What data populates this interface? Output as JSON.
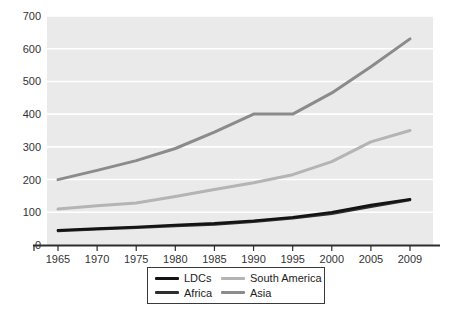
{
  "chart_data": {
    "type": "line",
    "categories": [
      "1965",
      "1970",
      "1975",
      "1980",
      "1985",
      "1990",
      "1995",
      "2000",
      "2005",
      "2009"
    ],
    "series": [
      {
        "name": "Asia",
        "color": "#8b8b8b",
        "width": 3,
        "values": [
          200,
          228,
          258,
          295,
          345,
          400,
          400,
          465,
          545,
          630
        ]
      },
      {
        "name": "South America",
        "color": "#b4b4b4",
        "width": 3,
        "values": [
          110,
          120,
          128,
          148,
          170,
          190,
          215,
          255,
          315,
          350
        ]
      },
      {
        "name": "Africa",
        "color": "#2e2e2e",
        "width": 2.6,
        "values": [
          43,
          48,
          53,
          58,
          63,
          71,
          82,
          96,
          117,
          138
        ]
      },
      {
        "name": "LDCs",
        "color": "#131313",
        "width": 2.6,
        "values": [
          45,
          50,
          55,
          61,
          66,
          74,
          85,
          100,
          122,
          140
        ]
      }
    ],
    "title": "",
    "xlabel": "",
    "ylabel": "",
    "ylim": [
      0,
      700
    ],
    "y_ticks": [
      0,
      100,
      200,
      300,
      400,
      500,
      600,
      700
    ],
    "grid": "horizontal-white-on-gray",
    "plot_bg": "#eaeaea",
    "gridline_color": "#ffffff",
    "axis_color": "#2e2e2e",
    "tick_label_color": "#333333",
    "legend_position": "bottom"
  },
  "legend": {
    "items": [
      {
        "label": "LDCs",
        "color": "#131313"
      },
      {
        "label": "South America",
        "color": "#b4b4b4"
      },
      {
        "label": "Africa",
        "color": "#2e2e2e"
      },
      {
        "label": "Asia",
        "color": "#8b8b8b"
      }
    ]
  }
}
